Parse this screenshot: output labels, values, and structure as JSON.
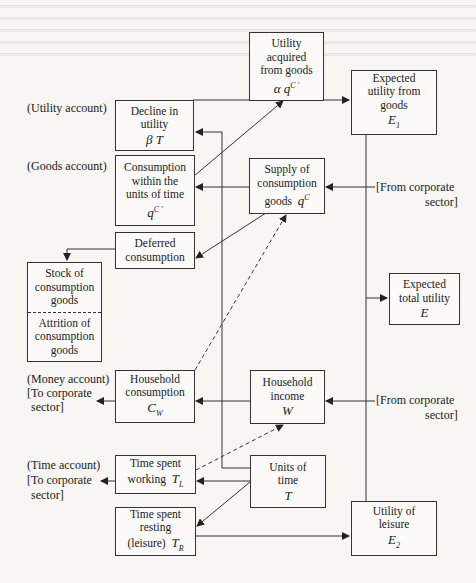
{
  "diagram": {
    "labels": {
      "utility_account": "(Utility account)",
      "goods_account": "(Goods account)",
      "money_account": "(Money account)",
      "money_to_corp_1": "[To corporate",
      "money_to_corp_2": "sector]",
      "time_account": "(Time account)",
      "time_to_corp_1": "[To corporate",
      "time_to_corp_2": "sector]",
      "from_corp_goods_1": "[From corporate",
      "from_corp_goods_2": "sector]",
      "from_corp_income_1": "[From corporate",
      "from_corp_income_2": "sector]"
    },
    "nodes": {
      "utility_acquired": {
        "lines": [
          "Utility",
          "acquired",
          "from goods"
        ],
        "symbol": "α q",
        "sup": "C ′"
      },
      "expected_utility_goods": {
        "lines": [
          "Expected",
          "utility from",
          "goods"
        ],
        "symbol": "E",
        "sub": "1"
      },
      "decline_utility": {
        "lines": [
          "Decline in",
          "utility"
        ],
        "symbol": "β T"
      },
      "consumption_within": {
        "lines": [
          "Consumption",
          "within the",
          "units of time"
        ],
        "symbol": "q",
        "sup": "C ′"
      },
      "supply_goods": {
        "lines": [
          "Supply of",
          "consumption"
        ],
        "line_last": "goods",
        "symbol": "q",
        "sup": "C"
      },
      "deferred_consumption": {
        "lines": [
          "Deferred",
          "consumption"
        ]
      },
      "stock_goods": {
        "lines": [
          "Stock of",
          "consumption",
          "goods"
        ]
      },
      "attrition_goods": {
        "lines": [
          "Attrition of",
          "consumption",
          "goods"
        ]
      },
      "expected_total_utility": {
        "lines": [
          "Expected",
          "total utility"
        ],
        "symbol": "E"
      },
      "household_consumption": {
        "lines": [
          "Household",
          "consumption"
        ],
        "symbol": "C",
        "sub": "W"
      },
      "household_income": {
        "lines": [
          "Household",
          "income"
        ],
        "symbol": "W"
      },
      "time_working": {
        "lines": [
          "Time spent"
        ],
        "line_last": "working",
        "symbol": "T",
        "sub": "L"
      },
      "units_time": {
        "lines": [
          "Units of",
          "time"
        ],
        "symbol": "T"
      },
      "time_resting": {
        "lines": [
          "Time spent",
          "resting"
        ],
        "line_last": "(leisure)",
        "symbol": "T",
        "sub": "R"
      },
      "utility_leisure": {
        "lines": [
          "Utility of",
          "leisure"
        ],
        "symbol": "E",
        "sub": "2"
      }
    },
    "edges": [
      {
        "from": "consumption_within",
        "to": "utility_acquired",
        "style": "solid"
      },
      {
        "from": "utility_acquired",
        "to": "expected_utility_goods",
        "style": "solid"
      },
      {
        "from": "units_time",
        "to": "decline_utility",
        "style": "solid"
      },
      {
        "from": "supply_goods",
        "to": "consumption_within",
        "style": "solid"
      },
      {
        "from": "supply_goods",
        "to": "deferred_consumption",
        "style": "solid"
      },
      {
        "from": "from_corporate_sector",
        "to": "supply_goods",
        "style": "solid"
      },
      {
        "from": "deferred_consumption",
        "to": "stock_goods",
        "style": "solid"
      },
      {
        "from": "expected_utility_goods",
        "to": "expected_total_utility",
        "style": "solid"
      },
      {
        "from": "utility_leisure",
        "to": "expected_total_utility",
        "style": "solid"
      },
      {
        "from": "household_consumption",
        "to": "supply_goods",
        "style": "dashed"
      },
      {
        "from": "household_income",
        "to": "household_consumption",
        "style": "solid"
      },
      {
        "from": "from_corporate_sector",
        "to": "household_income",
        "style": "solid"
      },
      {
        "from": "household_consumption",
        "to": "to_corporate_sector",
        "style": "solid"
      },
      {
        "from": "time_working",
        "to": "household_income",
        "style": "dashed"
      },
      {
        "from": "units_time",
        "to": "time_working",
        "style": "solid"
      },
      {
        "from": "units_time",
        "to": "time_resting",
        "style": "solid"
      },
      {
        "from": "time_working",
        "to": "to_corporate_sector",
        "style": "solid"
      },
      {
        "from": "time_resting",
        "to": "utility_leisure",
        "style": "solid"
      }
    ]
  }
}
